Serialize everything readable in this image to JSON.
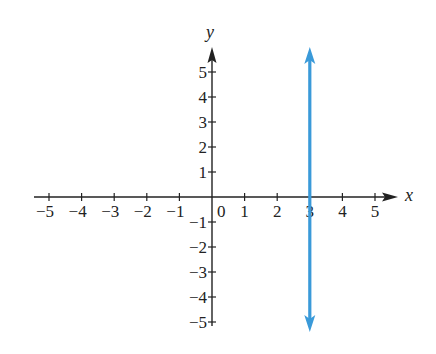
{
  "chart_data": {
    "type": "line",
    "title": "",
    "xlabel": "x",
    "ylabel": "y",
    "xlim": [
      -5,
      5
    ],
    "ylim": [
      -5,
      5
    ],
    "grid": false,
    "legend": null,
    "x_ticks": [
      -5,
      -4,
      -3,
      -2,
      -1,
      0,
      1,
      2,
      3,
      4,
      5
    ],
    "x_tick_labels": [
      "−5",
      "−4",
      "−3",
      "−2",
      "−1",
      "0",
      "1",
      "2",
      "3",
      "4",
      "5"
    ],
    "y_ticks": [
      -5,
      -4,
      -3,
      -2,
      -1,
      1,
      2,
      3,
      4,
      5
    ],
    "y_tick_labels": [
      "−5",
      "−4",
      "−3",
      "−2",
      "−1",
      "1",
      "2",
      "3",
      "4",
      "5"
    ],
    "series": [
      {
        "name": "x = 3",
        "kind": "vertical-line",
        "x": [
          3,
          3
        ],
        "y": [
          -5.4,
          5.8
        ],
        "arrows": "both",
        "color": "#3a9ad9"
      }
    ]
  },
  "colors": {
    "axis": "#222222",
    "line": "#3a9ad9"
  }
}
